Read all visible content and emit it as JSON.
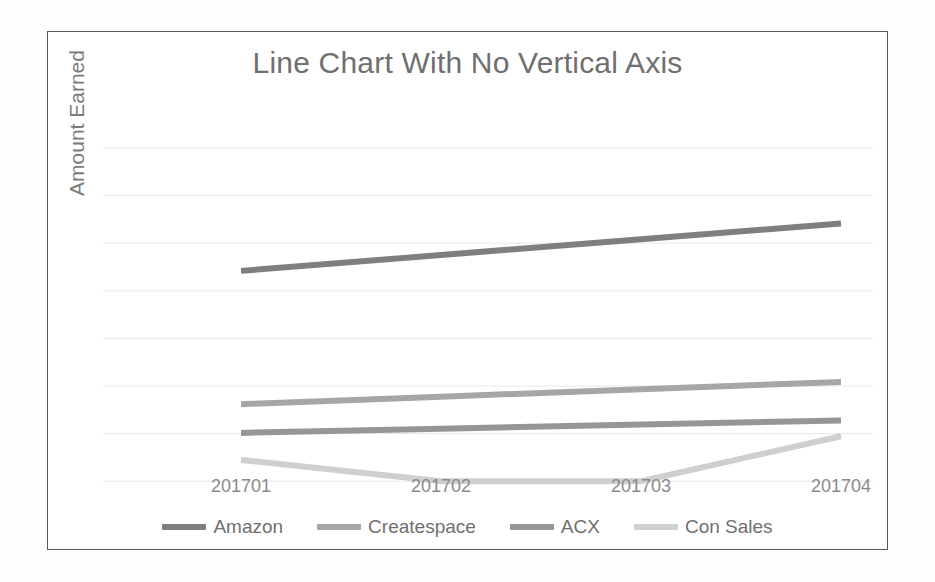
{
  "chart_data": {
    "type": "line",
    "title": "Line Chart With No Vertical Axis",
    "xlabel": "",
    "ylabel": "Amount Earned",
    "categories": [
      "201701",
      "201702",
      "201703",
      "201704"
    ],
    "grid": {
      "horizontal": true,
      "vertical": false,
      "gridline_count": 8,
      "color": "#e8e8e8"
    },
    "axes": {
      "vertical_axis_visible": false,
      "vertical_tick_labels_visible": false,
      "horizontal_axis_line_visible": false
    },
    "legend": {
      "position": "bottom",
      "entries": [
        "Amazon",
        "Createspace",
        "ACX",
        "Con Sales"
      ]
    },
    "ylim": [
      0,
      8
    ],
    "series": [
      {
        "name": "Amazon",
        "color": "#7f7f7f",
        "values": [
          5.05,
          5.43,
          5.81,
          6.19
        ],
        "trend": "steady increase"
      },
      {
        "name": "Createspace",
        "color": "#a6a6a6",
        "values": [
          1.85,
          2.03,
          2.21,
          2.38
        ],
        "trend": "slight increase"
      },
      {
        "name": "ACX",
        "color": "#969696",
        "values": [
          1.16,
          1.26,
          1.36,
          1.46
        ],
        "trend": "nearly flat, slight increase"
      },
      {
        "name": "Con Sales",
        "color": "#cfcfcf",
        "values": [
          0.51,
          0.0,
          0.0,
          1.08
        ],
        "trend": "dips to zero then rises sharply"
      }
    ]
  },
  "chart": {
    "title": "Line Chart With No Vertical Axis",
    "y_axis_title": "Amount Earned",
    "x_tick_labels": [
      "201701",
      "201702",
      "201703",
      "201704"
    ],
    "legend_entries": [
      {
        "label": "Amazon",
        "color": "#7f7f7f"
      },
      {
        "label": "Createspace",
        "color": "#a6a6a6"
      },
      {
        "label": "ACX",
        "color": "#969696"
      },
      {
        "label": "Con Sales",
        "color": "#cfcfcf"
      }
    ],
    "colors": {
      "title_text": "#6f6f6f",
      "axis_text": "#8a8a8a",
      "gridline": "#e8e8e8",
      "frame_border": "#595959",
      "plot_background": "#ffffff"
    }
  }
}
